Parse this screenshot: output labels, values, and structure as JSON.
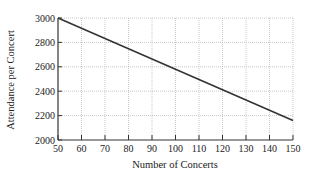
{
  "chart_data": {
    "type": "line",
    "title": "",
    "xlabel": "Number of Concerts",
    "ylabel": "Attendance per Concert",
    "xlim": [
      50,
      150
    ],
    "ylim": [
      2000,
      3000
    ],
    "xticks": [
      50,
      60,
      70,
      80,
      90,
      100,
      110,
      120,
      130,
      140,
      150
    ],
    "yticks": [
      2000,
      2200,
      2400,
      2600,
      2800,
      3000
    ],
    "grid": true,
    "legend": null,
    "series": [
      {
        "name": "Attendance",
        "x": [
          50,
          150
        ],
        "y": [
          3000,
          2160
        ]
      }
    ]
  }
}
